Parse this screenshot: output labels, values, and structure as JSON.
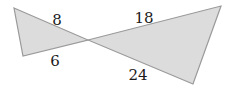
{
  "diagram": {
    "fill_color": "#dcdcdc",
    "stroke_color": "#9a9a9a",
    "label_color": "#1a1a1a",
    "left_triangle": {
      "labels": {
        "upper_side": "8",
        "lower_side": "6"
      }
    },
    "right_triangle": {
      "labels": {
        "upper_side": "18",
        "lower_side": "24"
      }
    }
  }
}
